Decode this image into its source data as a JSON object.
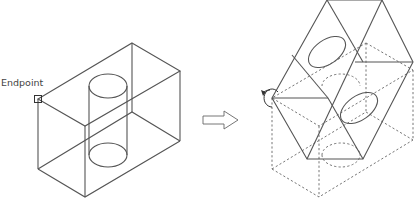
{
  "diagram": {
    "type": "cad-3d-rotation-illustration",
    "left_figure": {
      "label": "Endpoint",
      "description": "Wireframe box with vertical cylinder, endpoint snap marker at left corner"
    },
    "arrow": {
      "icon": "right-arrow-icon"
    },
    "right_figure": {
      "description": "Box rotated about axis through endpoint; original position shown dashed",
      "rotation_icon": "rotate-icon"
    },
    "colors": {
      "line": "#555555",
      "hidden_line": "#666666",
      "background": "#ffffff"
    }
  }
}
